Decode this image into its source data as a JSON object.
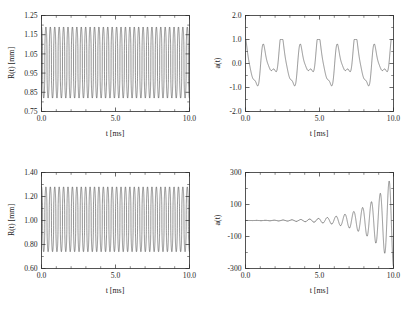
{
  "figure": {
    "background": "#ffffff",
    "curve_color": "#3a3a3a",
    "axis_color": "#2b2b2b",
    "rows": 2,
    "cols": 2
  },
  "chart_data": [
    {
      "id": "top-left",
      "type": "line",
      "title": "",
      "xlabel": "t  [ms]",
      "ylabel": "R(t) [mm]",
      "xlim": [
        0.0,
        10.0
      ],
      "ylim": [
        0.75,
        1.25
      ],
      "xticks": [
        0.0,
        5.0,
        10.0
      ],
      "xticklabels": [
        "0.0",
        "5.0",
        "10.0"
      ],
      "yticks": [
        0.75,
        0.85,
        0.95,
        1.05,
        1.15,
        1.25
      ],
      "yticklabels": [
        "0.75",
        "0.85",
        "0.95",
        "1.05",
        "1.15",
        "1.25"
      ],
      "grid": false,
      "legend": "none",
      "description": "Steady periodic radial bubble oscillation, ~33.5 cycles over 10 ms (f approx 3.35 kHz), peaks near 1.19 mm and troughs near 0.82 mm, with sharp collapse minima.",
      "series": [
        {
          "name": "R(t)",
          "waveform": "periodic-collapse",
          "frequency_khz": 3.35,
          "peak": 1.19,
          "trough": 0.82,
          "mean": 1.0,
          "phase": 0.0,
          "sharpness": 2.6
        }
      ]
    },
    {
      "id": "top-right",
      "type": "line",
      "title": "",
      "xlabel": "t [ms]",
      "ylabel": "a(t)",
      "xlim": [
        0.0,
        10.0
      ],
      "ylim": [
        -2.0,
        2.0
      ],
      "xticks": [
        0.0,
        5.0,
        10.0
      ],
      "xticklabels": [
        "0.0",
        "5.0",
        "10.0"
      ],
      "yticks": [
        -2.0,
        -1.0,
        0.0,
        1.0,
        2.0
      ],
      "yticklabels": [
        "-2.0",
        "-1.0",
        "0.0",
        "1.0",
        "2.0"
      ],
      "grid": false,
      "legend": "none",
      "description": "Bounded shape-mode amplitude a(t) with period-doubled character: about 8 major cycles over 10 ms, amplitude roughly +/-1.0, each crest and trough carrying a secondary sub-peak.",
      "series": [
        {
          "name": "a(t)",
          "waveform": "period-doubled-bounded",
          "frequency_khz": 0.8,
          "amplitude": 1.0,
          "sub_amplitude": 0.28,
          "phase": 0.0
        }
      ]
    },
    {
      "id": "bottom-left",
      "type": "line",
      "title": "",
      "xlabel": "t  [ms]",
      "ylabel": "R(t) [mm]",
      "xlim": [
        0.0,
        10.0
      ],
      "ylim": [
        0.6,
        1.4
      ],
      "xticks": [
        0.0,
        5.0,
        10.0
      ],
      "xticklabels": [
        "0.0",
        "5.0",
        "10.0"
      ],
      "yticks": [
        0.6,
        0.8,
        1.0,
        1.2,
        1.4
      ],
      "yticklabels": [
        "0.60",
        "0.80",
        "1.00",
        "1.20",
        "1.40"
      ],
      "grid": false,
      "legend": "false",
      "description": "Steady periodic radial bubble oscillation with larger excursion, ~33.5 cycles over 10 ms, peaks near 1.28 mm and troughs near 0.74 mm.",
      "series": [
        {
          "name": "R(t)",
          "waveform": "periodic-collapse",
          "frequency_khz": 3.35,
          "peak": 1.28,
          "trough": 0.74,
          "mean": 1.0,
          "phase": 0.0,
          "sharpness": 2.4
        }
      ]
    },
    {
      "id": "bottom-right",
      "type": "line",
      "title": "",
      "xlabel": "t [ms]",
      "ylabel": "a(t)",
      "xlim": [
        0.0,
        10.0
      ],
      "ylim": [
        -300,
        300
      ],
      "xticks": [
        0.0,
        5.0,
        10.0
      ],
      "xticklabels": [
        "0.0",
        "5.0",
        "10.0"
      ],
      "yticks": [
        -300,
        -100,
        100,
        300
      ],
      "yticklabels": [
        "-300",
        "-100",
        "100",
        "300"
      ],
      "grid": false,
      "legend": "none",
      "description": "Parametrically unstable shape-mode amplitude a(t) growing exponentially from near zero to about +/-280 by 10 ms; oscillation frequency about 1.7 kHz (half the radial driving frequency).",
      "series": [
        {
          "name": "a(t)",
          "waveform": "exponential-growth",
          "frequency_khz": 1.675,
          "final_amplitude": 280,
          "growth_rate_per_ms": 0.62,
          "initial_amplitude": 0.6,
          "phase": 0.0
        }
      ]
    }
  ]
}
